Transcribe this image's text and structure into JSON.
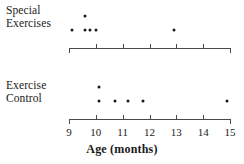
{
  "chart_data": {
    "type": "scatter",
    "title": "",
    "xlabel": "Age (months)",
    "ylabel": "",
    "xlim": [
      9,
      15
    ],
    "xticks": [
      9,
      10,
      11,
      12,
      13,
      14,
      15
    ],
    "xtick_labels": [
      "9",
      "10",
      "11",
      "12",
      "13",
      "14",
      "15"
    ],
    "grid": false,
    "legend": "none",
    "note": "Two stacked dotplots of age (months) at first walking, one panel per treatment group",
    "groups": [
      {
        "name": "Special Exercises",
        "label_lines": [
          "Special",
          "Exercises"
        ],
        "values": [
          9.1,
          9.6,
          9.6,
          9.8,
          10.0,
          12.9
        ],
        "dots": [
          {
            "x": 9.1,
            "stack": 1
          },
          {
            "x": 9.6,
            "stack": 1
          },
          {
            "x": 9.6,
            "stack": 2
          },
          {
            "x": 9.8,
            "stack": 1
          },
          {
            "x": 10.0,
            "stack": 1
          },
          {
            "x": 12.9,
            "stack": 1
          }
        ]
      },
      {
        "name": "Exercise Control",
        "label_lines": [
          "Exercise",
          "Control"
        ],
        "values": [
          10.1,
          10.1,
          10.7,
          11.2,
          11.75,
          14.9
        ],
        "dots": [
          {
            "x": 10.1,
            "stack": 1
          },
          {
            "x": 10.1,
            "stack": 2
          },
          {
            "x": 10.7,
            "stack": 1
          },
          {
            "x": 11.2,
            "stack": 1
          },
          {
            "x": 11.75,
            "stack": 1
          },
          {
            "x": 14.9,
            "stack": 1
          }
        ]
      }
    ]
  },
  "axis": {
    "title": "Age (months)",
    "ticks": [
      "9",
      "10",
      "11",
      "12",
      "13",
      "14",
      "15"
    ],
    "color": "#4a4a4a"
  },
  "panels": {
    "top": {
      "label_line1": "Special",
      "label_line2": "Exercises"
    },
    "bottom": {
      "label_line1": "Exercise",
      "label_line2": "Control"
    }
  },
  "colors": {
    "dot": "#1a1a1a",
    "axis": "#4a4a4a",
    "background": "#ffffff"
  }
}
